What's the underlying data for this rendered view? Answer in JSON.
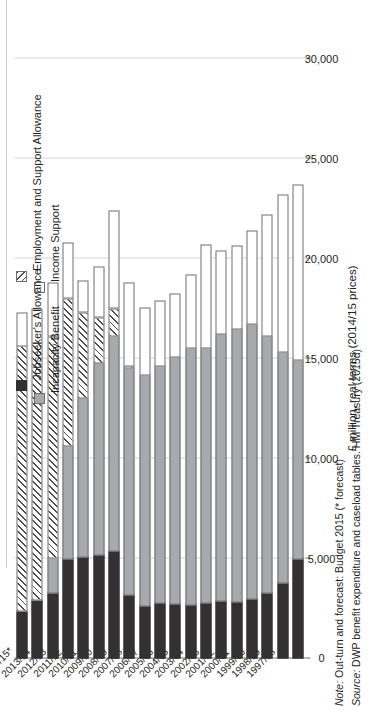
{
  "axis_title": "£ million, real terms (2014/15 prices)",
  "legend": [
    {
      "key": "is",
      "label": "Income Support",
      "swatch": "white-box"
    },
    {
      "key": "ib",
      "label": "Incapacity Benefit",
      "swatch": "grey-box"
    },
    {
      "key": "esa",
      "label": "Employment and Support Allowance",
      "swatch": "hatched-box"
    },
    {
      "key": "jsa",
      "label": "Jobseeker's Allowance",
      "swatch": "black-box"
    }
  ],
  "footnotes": {
    "note": "Note: Out-turn and forecast: Budget 2015 (* forecast)",
    "source": "Source: DWP benefit expenditure and caseload tables. HM Treasury (2015d)"
  },
  "colors": {
    "income_support": "#ffffff",
    "incapacity_benefit": "#a7a9ac",
    "employment_and_support_allowance": "#ffffff",
    "jobseekers_allowance": "#333132",
    "outline": "#6e6e6e",
    "gridline": "#d4d4d4",
    "axis": "#6d6d6d",
    "text": "#231f20"
  },
  "chart_data": {
    "type": "bar",
    "orientation": "horizontal",
    "stacked": true,
    "title": "",
    "xlabel": "",
    "ylabel": "£ million, real terms (2014/15 prices)",
    "ylim": [
      0,
      30000
    ],
    "yticks": [
      "0",
      "5,000",
      "10,000",
      "15,000",
      "20,000",
      "25,000",
      "30,000"
    ],
    "ytick_values": [
      0,
      5000,
      10000,
      15000,
      20000,
      25000,
      30000
    ],
    "grid": true,
    "legend_position": "top-left",
    "stack_order_from_axis": [
      "Jobseeker's Allowance",
      "Incapacity Benefit",
      "Employment and Support Allowance",
      "Income Support"
    ],
    "categories": [
      "1997/98",
      "1998/99",
      "1999/00",
      "2000/01",
      "2001/02",
      "2002/03",
      "2003/04",
      "2004/05",
      "2005/06",
      "2006/07",
      "2007/08",
      "2008/09",
      "2009/10",
      "2010/11",
      "2011/12",
      "2012/13",
      "2013/14",
      "2014/15*",
      "2015/16*"
    ],
    "series": [
      {
        "name": "Jobseeker's Allowance",
        "values": [
          5000,
          3800,
          3300,
          3000,
          2850,
          2900,
          2800,
          2700,
          2750,
          2800,
          2650,
          3200,
          5400,
          5200,
          5100,
          5000,
          3300,
          2950,
          2400
        ]
      },
      {
        "name": "Incapacity Benefit",
        "values": [
          10000,
          11600,
          12900,
          13800,
          13700,
          13400,
          12800,
          12900,
          12400,
          11900,
          11600,
          11400,
          10800,
          9650,
          8000,
          5700,
          1800,
          0,
          0
        ]
      },
      {
        "name": "Employment and Support Allowance",
        "values": [
          0,
          0,
          0,
          0,
          0,
          0,
          0,
          0,
          0,
          0,
          0,
          120,
          1400,
          2300,
          4300,
          7400,
          11100,
          12900,
          13300
        ]
      },
      {
        "name": "Income Support",
        "values": [
          8800,
          7900,
          6100,
          4700,
          4200,
          4200,
          5200,
          3700,
          3200,
          3300,
          3400,
          4200,
          4900,
          2550,
          1600,
          2800,
          2700,
          1750,
          1700
        ]
      }
    ],
    "totals": [
      23800,
      23300,
      22300,
      21500,
      20750,
      20500,
      20800,
      19300,
      18350,
      18000,
      17650,
      18920,
      22500,
      19700,
      19000,
      20900,
      18900,
      17600,
      17400
    ]
  }
}
